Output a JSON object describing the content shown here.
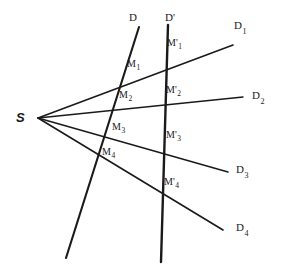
{
  "figure": {
    "type": "geometry-diagram",
    "width": 283,
    "height": 268,
    "background_color": "#ffffff",
    "stroke_color": "#1a1a1a",
    "text_color": "#1a1a1a"
  },
  "source_point": {
    "label": "S",
    "x": 38,
    "y": 118,
    "label_x": 16,
    "label_y": 111
  },
  "transversals": [
    {
      "id": "D",
      "label": "D",
      "label_x": 129,
      "label_y": 12,
      "x1": 139,
      "y1": 27,
      "x2": 66,
      "y2": 258,
      "stroke_width": 2.1
    },
    {
      "id": "D-prime",
      "label": "D",
      "prime": "'",
      "label_x": 165,
      "label_y": 12,
      "x1": 168,
      "y1": 25,
      "x2": 161,
      "y2": 262,
      "stroke_width": 2.4
    }
  ],
  "rays": [
    {
      "id": "D1",
      "label_base": "D",
      "label_sub": "1",
      "label_x": 234,
      "label_y": 20,
      "x1": 38,
      "y1": 118,
      "x2": 233,
      "y2": 45,
      "stroke_width": 1.6
    },
    {
      "id": "D2",
      "label_base": "D",
      "label_sub": "2",
      "label_x": 252,
      "label_y": 90,
      "x1": 38,
      "y1": 118,
      "x2": 243,
      "y2": 97,
      "stroke_width": 1.4
    },
    {
      "id": "D3",
      "label_base": "D",
      "label_sub": "3",
      "label_x": 236,
      "label_y": 164,
      "x1": 38,
      "y1": 118,
      "x2": 228,
      "y2": 172,
      "stroke_width": 1.5
    },
    {
      "id": "D4",
      "label_base": "D",
      "label_sub": "4",
      "label_x": 236,
      "label_y": 222,
      "x1": 38,
      "y1": 118,
      "x2": 223,
      "y2": 230,
      "stroke_width": 1.6
    }
  ],
  "intersections_D": [
    {
      "id": "M1",
      "label_base": "M",
      "label_sub": "1",
      "x": 125,
      "y": 82,
      "label_x": 127,
      "label_y": 59
    },
    {
      "id": "M2",
      "label_base": "M",
      "label_sub": "2",
      "x": 117,
      "y": 105,
      "label_x": 119,
      "label_y": 90
    },
    {
      "id": "M3",
      "label_base": "M",
      "label_sub": "3",
      "x": 108,
      "y": 133,
      "label_x": 112,
      "label_y": 122
    },
    {
      "id": "M4",
      "label_base": "M",
      "label_sub": "4",
      "x": 97,
      "y": 160,
      "label_x": 102,
      "label_y": 147
    }
  ],
  "intersections_Dprime": [
    {
      "id": "M1p",
      "label_base": "M",
      "prime": "'",
      "label_sub": "1",
      "x": 167,
      "y": 66,
      "label_x": 167,
      "label_y": 38
    },
    {
      "id": "M2p",
      "label_base": "M",
      "prime": "'",
      "label_sub": "2",
      "x": 165,
      "y": 105,
      "label_x": 166,
      "label_y": 85
    },
    {
      "id": "M3p",
      "label_base": "M",
      "prime": "'",
      "label_sub": "3",
      "x": 164,
      "y": 148,
      "label_x": 166,
      "label_y": 130
    },
    {
      "id": "M4p",
      "label_base": "M",
      "prime": "'",
      "label_sub": "4",
      "x": 162,
      "y": 195,
      "label_x": 164,
      "label_y": 177
    }
  ]
}
